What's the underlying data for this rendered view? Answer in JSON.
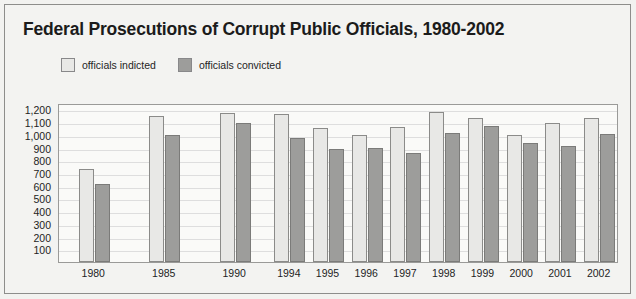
{
  "chart_data": {
    "type": "bar",
    "title": "Federal Prosecutions of Corrupt Public Officials, 1980-2002",
    "xlabel": "",
    "ylabel": "",
    "grid": true,
    "legend_position": "top-left",
    "ylim": [
      0,
      1250
    ],
    "ytick_step": 100,
    "yticks": [
      "1,200",
      "1,100",
      "1,000",
      "900",
      "800",
      "700",
      "600",
      "500",
      "400",
      "300",
      "200",
      "100"
    ],
    "ytick_values": [
      1200,
      1100,
      1000,
      900,
      800,
      700,
      600,
      500,
      400,
      300,
      200,
      100
    ],
    "categories": [
      "1980",
      "1985",
      "1990",
      "1994",
      "1995",
      "1996",
      "1997",
      "1998",
      "1999",
      "2000",
      "2001",
      "2002"
    ],
    "series": [
      {
        "name": "officials indicted",
        "color": "#e8e8e6",
        "values": [
          730,
          1150,
          1175,
          1160,
          1050,
          995,
          1060,
          1180,
          1135,
          1000,
          1090,
          1135
        ]
      },
      {
        "name": "officials convicted",
        "color": "#9d9d9b",
        "values": [
          615,
          1000,
          1090,
          975,
          885,
          900,
          860,
          1015,
          1070,
          935,
          915,
          1010
        ]
      }
    ]
  },
  "colors": {
    "page_background": "#f3f3f1",
    "plot_background": "#fafaf8",
    "gridline": "#dedede",
    "frame": "#9a9a98",
    "text": "#1e1e1e",
    "indicted": "#e8e8e6",
    "convicted": "#9d9d9b"
  }
}
